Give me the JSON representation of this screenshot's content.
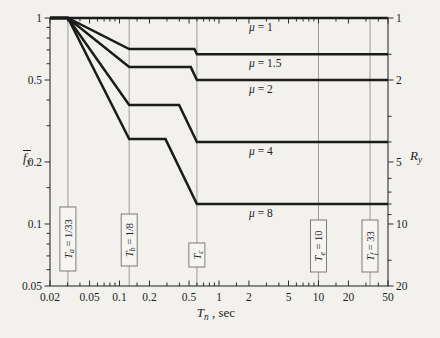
{
  "figure": {
    "background": "#f2f1ee"
  },
  "chart_data": {
    "type": "line",
    "title": "",
    "x_axis": {
      "label": {
        "main": "T",
        "sub": "n",
        "rest": " , sec"
      },
      "scale": "log",
      "range": [
        0.02,
        50
      ],
      "major_ticks": [
        {
          "v": 0.02,
          "label": "0.02"
        },
        {
          "v": 0.05,
          "label": "0.05"
        },
        {
          "v": 0.1,
          "label": "0.1"
        },
        {
          "v": 0.2,
          "label": "0.2"
        },
        {
          "v": 0.5,
          "label": "0.5"
        },
        {
          "v": 1,
          "label": "1"
        },
        {
          "v": 2,
          "label": "2"
        },
        {
          "v": 5,
          "label": "5"
        },
        {
          "v": 10,
          "label": "10"
        },
        {
          "v": 20,
          "label": "20"
        },
        {
          "v": 50,
          "label": "50"
        }
      ],
      "minor_ticks": [
        0.03,
        0.04,
        0.06,
        0.07,
        0.08,
        0.09,
        0.15,
        0.3,
        0.4,
        0.6,
        0.7,
        0.8,
        0.9,
        1.5,
        3,
        4,
        6,
        7,
        8,
        9,
        15,
        30,
        40
      ]
    },
    "y_left_axis": {
      "label": {
        "main": "f",
        "sub": "y",
        "overbar": true
      },
      "scale": "log",
      "range": [
        0.05,
        1
      ],
      "major_ticks": [
        {
          "v": 1,
          "label": "1"
        },
        {
          "v": 0.5,
          "label": "0.5"
        },
        {
          "v": 0.2,
          "label": "0.2"
        },
        {
          "v": 0.1,
          "label": "0.1"
        },
        {
          "v": 0.05,
          "label": "0.05"
        }
      ],
      "minor_ticks": [
        0.9,
        0.8,
        0.7,
        0.6,
        0.4,
        0.3,
        0.15,
        0.09,
        0.08,
        0.07,
        0.06
      ]
    },
    "y_right_axis": {
      "label": {
        "main": "R",
        "sub": "y"
      },
      "scale": "log-inverse",
      "range": [
        1,
        20
      ],
      "major_ticks": [
        {
          "v": 1,
          "label": "1"
        },
        {
          "v": 2,
          "label": "2"
        },
        {
          "v": 5,
          "label": "5"
        },
        {
          "v": 10,
          "label": "10"
        },
        {
          "v": 20,
          "label": "20"
        }
      ],
      "minor_ticks": [
        1.5,
        3,
        4,
        6,
        7,
        8,
        9,
        15
      ]
    },
    "series": [
      {
        "name": "mu-1",
        "label": {
          "greek": "μ",
          "rest": " = 1"
        },
        "points": [
          [
            0.02,
            1
          ],
          [
            50,
            1
          ]
        ]
      },
      {
        "name": "mu-1-5",
        "label": {
          "greek": "μ",
          "rest": " = 1.5"
        },
        "points": [
          [
            0.02,
            1
          ],
          [
            0.0303,
            1
          ],
          [
            0.125,
            0.7071
          ],
          [
            0.566,
            0.7071
          ],
          [
            0.6,
            0.6667
          ],
          [
            50,
            0.6667
          ]
        ]
      },
      {
        "name": "mu-2",
        "label": {
          "greek": "μ",
          "rest": " = 2"
        },
        "points": [
          [
            0.02,
            1
          ],
          [
            0.0303,
            1
          ],
          [
            0.125,
            0.5774
          ],
          [
            0.52,
            0.5774
          ],
          [
            0.6,
            0.5
          ],
          [
            50,
            0.5
          ]
        ]
      },
      {
        "name": "mu-4",
        "label": {
          "greek": "μ",
          "rest": " = 4"
        },
        "points": [
          [
            0.02,
            1
          ],
          [
            0.0303,
            1
          ],
          [
            0.125,
            0.378
          ],
          [
            0.397,
            0.378
          ],
          [
            0.6,
            0.25
          ],
          [
            50,
            0.25
          ]
        ]
      },
      {
        "name": "mu-8",
        "label": {
          "greek": "μ",
          "rest": " = 8"
        },
        "points": [
          [
            0.02,
            1
          ],
          [
            0.0303,
            1
          ],
          [
            0.125,
            0.2582
          ],
          [
            0.29,
            0.2582
          ],
          [
            0.6,
            0.125
          ],
          [
            50,
            0.125
          ]
        ]
      }
    ],
    "reference_lines": [
      {
        "name": "Ta",
        "T": 0.0303,
        "label": {
          "main": "T",
          "sub": "a",
          "rest": " = 1/33"
        },
        "box": {
          "cy": 239,
          "h": 64
        }
      },
      {
        "name": "Tb",
        "T": 0.125,
        "label": {
          "main": "T",
          "sub": "b",
          "rest": " = 1/8"
        },
        "box": {
          "cy": 240,
          "h": 52
        }
      },
      {
        "name": "Tc",
        "T": 0.6,
        "label": {
          "main": "T",
          "sub": "c",
          "rest": ""
        },
        "box": {
          "cy": 255,
          "h": 24
        }
      },
      {
        "name": "Te",
        "T": 10,
        "label": {
          "main": "T",
          "sub": "e",
          "rest": " = 10"
        },
        "box": {
          "cy": 246,
          "h": 52
        }
      },
      {
        "name": "Tf",
        "T": 33,
        "label": {
          "main": "T",
          "sub": "f",
          "rest": " = 33"
        },
        "box": {
          "cy": 246,
          "h": 52
        }
      }
    ],
    "curve_label_x": 249,
    "legend_position": "inline-right-of-each-curve",
    "grid": "vertical-reference-lines-only",
    "colors": {
      "curve": "#1b1b1b",
      "frame": "#2e2e2e",
      "refline": "#9b9b9b",
      "box_fill": "#f6f5f2",
      "box_border": "#6f6f6f",
      "text": "#1e1e1e",
      "background": "#f2f1ee"
    },
    "layout": {
      "plot": {
        "left": 50,
        "top": 18,
        "right": 388,
        "bottom": 286
      },
      "tick_len": {
        "major": 5.5,
        "minor": 3.5
      }
    }
  }
}
